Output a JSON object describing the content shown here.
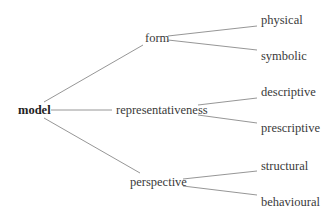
{
  "diagram": {
    "type": "tree",
    "root": {
      "label": "model"
    },
    "branches": [
      {
        "label": "form",
        "children": [
          {
            "label": "physical"
          },
          {
            "label": "symbolic"
          }
        ]
      },
      {
        "label": "representativeness",
        "children": [
          {
            "label": "descriptive"
          },
          {
            "label": "prescriptive"
          }
        ]
      },
      {
        "label": "perspective",
        "children": [
          {
            "label": "structural"
          },
          {
            "label": "behavioural"
          }
        ]
      }
    ],
    "colors": {
      "text": "#3a3a3a",
      "lines": "#8a8a8a",
      "background": "#ffffff"
    }
  }
}
